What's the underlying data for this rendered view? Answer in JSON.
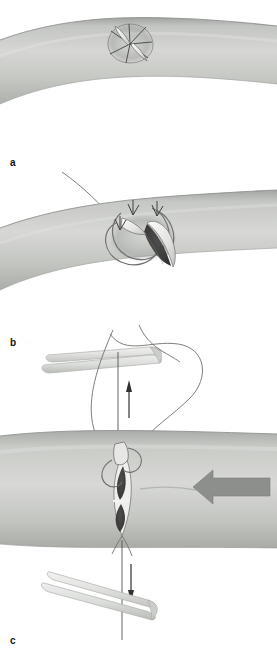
{
  "figure": {
    "panel_count": 3,
    "background_color": "#ffffff"
  },
  "panels": [
    {
      "id": "a",
      "label": "a",
      "caption_text": "a",
      "description": "Curved tubular vessel with stellate (star-shaped) incision marked on its surface",
      "elements": [
        "vessel-tube-curved",
        "stellate-incision",
        "incision-spokes",
        "raised-flaps"
      ]
    },
    {
      "id": "b",
      "label": "b",
      "caption_text": "b",
      "description": "Vessel with incision flaps everted, suture loops passed through the flaps, opening exposed",
      "elements": [
        "vessel-tube-curved",
        "opened-flaps",
        "dark-lumen",
        "suture-loops",
        "retraction-arrowheads",
        "trailing-suture"
      ]
    },
    {
      "id": "c",
      "label": "c",
      "caption_text": "c",
      "description": "Horizontal vessel segment with lenticular opening held by sutures, forceps above and below applying traction, directional arrows",
      "elements": [
        "vessel-tube-straight",
        "lenticular-opening",
        "suture-knot",
        "suture-loops",
        "upper-forceps",
        "lower-forceps",
        "up-arrow",
        "down-arrow",
        "left-pointing-block-arrow"
      ]
    }
  ],
  "colors": {
    "vessel_light": "#d3d4d2",
    "vessel_mid": "#b9bbb8",
    "vessel_dark": "#9ea19d",
    "vessel_edge": "#8b8e8a",
    "lumen_dark": "#3b3c3b",
    "flap_white": "#f4f4f2",
    "instrument_light": "#e8e9e6",
    "instrument_shade": "#c9cbc7",
    "arrow_gray": "#8c8f8b",
    "line_stroke": "#4a4b4a",
    "suture_stroke": "#6f716e",
    "label_color": "#111111"
  },
  "annotations": {
    "up_arrow_name": "traction-up",
    "down_arrow_name": "traction-down",
    "block_arrow_name": "compression-direction",
    "block_arrow_direction": "left"
  }
}
